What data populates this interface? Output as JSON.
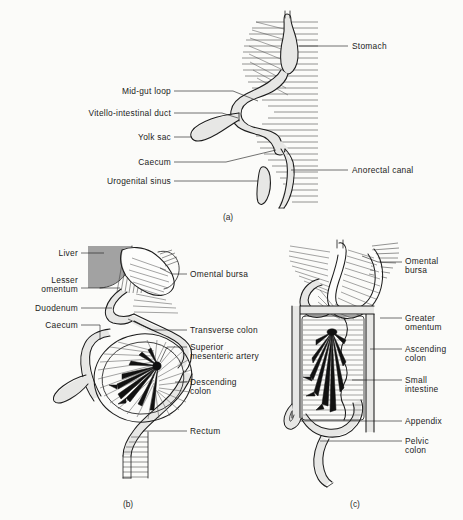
{
  "figure": {
    "background_color": "#fbfbf9",
    "ink_color": "#1c1c1c",
    "gut_fill_color": "#e7e7e5",
    "liver_fill_color": "#a2a2a2",
    "artery_color": "#111111",
    "panel_count": 3
  },
  "panels": [
    {
      "id": "a",
      "caption": "(a)",
      "stage": "Early mid-gut loop stage",
      "labels": [
        {
          "id": "stomach",
          "text": "Stomach",
          "side": "right",
          "x": 352,
          "y": 46
        },
        {
          "id": "mid-gut-loop",
          "text": "Mid-gut loop",
          "side": "left",
          "x": 171,
          "y": 94
        },
        {
          "id": "vitello-intestinal-duct",
          "text": "Vitello-intestinal duct",
          "side": "left",
          "x": 171,
          "y": 116
        },
        {
          "id": "yolk-sac",
          "text": "Yolk sac",
          "side": "left",
          "x": 171,
          "y": 140
        },
        {
          "id": "caecum",
          "text": "Caecum",
          "side": "left",
          "x": 171,
          "y": 165
        },
        {
          "id": "urogenital-sinus",
          "text": "Urogenital sinus",
          "side": "left",
          "x": 171,
          "y": 184
        },
        {
          "id": "anorectal-canal",
          "text": "Anorectal canal",
          "side": "right",
          "x": 352,
          "y": 170
        }
      ]
    },
    {
      "id": "b",
      "caption": "(b)",
      "stage": "Mid-gut rotation with mesentery",
      "labels": [
        {
          "id": "liver",
          "text": "Liver",
          "side": "left",
          "x": 78,
          "y": 256
        },
        {
          "id": "lesser-omentum",
          "text": "Lesser\nomentum",
          "side": "left",
          "x": 78,
          "y": 283
        },
        {
          "id": "duodenum",
          "text": "Duodenum",
          "side": "left",
          "x": 78,
          "y": 311
        },
        {
          "id": "caecum",
          "text": "Caecum",
          "side": "left",
          "x": 78,
          "y": 328
        },
        {
          "id": "omental-bursa",
          "text": "Omental bursa",
          "side": "right",
          "x": 190,
          "y": 277
        },
        {
          "id": "transverse-colon",
          "text": "Transverse colon",
          "side": "right",
          "x": 190,
          "y": 333
        },
        {
          "id": "superior-mesenteric-artery",
          "text": "Superior\nmesenteric artery",
          "side": "right",
          "x": 190,
          "y": 350
        },
        {
          "id": "descending-colon",
          "text": "Descending\ncolon",
          "side": "right",
          "x": 190,
          "y": 385
        },
        {
          "id": "rectum",
          "text": "Rectum",
          "side": "right",
          "x": 190,
          "y": 434
        }
      ]
    },
    {
      "id": "c",
      "caption": "(c)",
      "stage": "Definitive arrangement with greater omentum",
      "labels": [
        {
          "id": "omental-bursa",
          "text": "Omental\nbursa",
          "side": "right",
          "x": 405,
          "y": 264
        },
        {
          "id": "greater-omentum",
          "text": "Greater\nomentum",
          "side": "right",
          "x": 405,
          "y": 321
        },
        {
          "id": "ascending-colon",
          "text": "Ascending\ncolon",
          "side": "right",
          "x": 405,
          "y": 352
        },
        {
          "id": "small-intestine",
          "text": "Small\nintestine",
          "side": "right",
          "x": 405,
          "y": 383
        },
        {
          "id": "appendix",
          "text": "Appendix",
          "side": "right",
          "x": 405,
          "y": 424
        },
        {
          "id": "pelvic-colon",
          "text": "Pelvic\ncolon",
          "side": "right",
          "x": 405,
          "y": 444
        }
      ]
    }
  ],
  "captions": [
    {
      "id": "caption-a",
      "text": "(a)",
      "x": 228,
      "y": 218
    },
    {
      "id": "caption-b",
      "text": "(b)",
      "x": 128,
      "y": 505
    },
    {
      "id": "caption-c",
      "text": "(c)",
      "x": 355,
      "y": 505
    }
  ],
  "label_text": {
    "a_stomach": "Stomach",
    "a_midgut": "Mid-gut loop",
    "a_vitello": "Vitello-intestinal duct",
    "a_yolk": "Yolk sac",
    "a_caecum": "Caecum",
    "a_urogenital": "Urogenital sinus",
    "a_anorectal": "Anorectal canal",
    "b_liver": "Liver",
    "b_lesser1": "Lesser",
    "b_lesser2": "omentum",
    "b_duodenum": "Duodenum",
    "b_caecum": "Caecum",
    "b_bursa": "Omental bursa",
    "b_transverse": "Transverse colon",
    "b_sma1": "Superior",
    "b_sma2": "mesenteric artery",
    "b_desc1": "Descending",
    "b_desc2": "colon",
    "b_rectum": "Rectum",
    "c_bursa1": "Omental",
    "c_bursa2": "bursa",
    "c_greater1": "Greater",
    "c_greater2": "omentum",
    "c_asc1": "Ascending",
    "c_asc2": "colon",
    "c_small1": "Small",
    "c_small2": "intestine",
    "c_appendix": "Appendix",
    "c_pelvic1": "Pelvic",
    "c_pelvic2": "colon",
    "cap_a": "(a)",
    "cap_b": "(b)",
    "cap_c": "(c)"
  }
}
